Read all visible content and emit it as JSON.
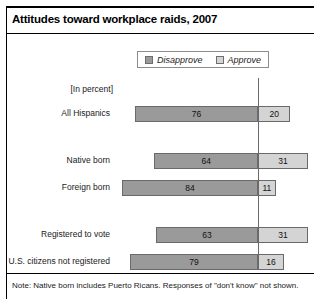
{
  "chart": {
    "title": "Attitudes toward workplace raids, 2007",
    "unit_note": "[In percent]",
    "note": "Note: Native born includes Puerto Ricans. Responses of \"don't know\" not shown."
  },
  "legend": {
    "items": [
      {
        "label": "Disapprove",
        "color": "#9a9a9a"
      },
      {
        "label": "Approve",
        "color": "#d4d4d4"
      }
    ]
  },
  "chart_data": {
    "type": "bar",
    "title": "Attitudes toward workplace raids, 2007",
    "subtitle": "[In percent]",
    "orientation": "horizontal",
    "stacked": true,
    "xlabel": "",
    "ylabel": "",
    "note": "Note: Native born includes Puerto Ricans. Responses of \"don't know\" not shown.",
    "legend_position": "top-center",
    "grid": false,
    "divider_at": "boundary between Disapprove and Approve",
    "categories": [
      "All Hispanics",
      "Native born",
      "Foreign born",
      "Registered to vote",
      "U.S. citizens not registered"
    ],
    "series": [
      {
        "name": "Disapprove",
        "color": "#9a9a9a",
        "values": [
          76,
          64,
          84,
          63,
          79
        ]
      },
      {
        "name": "Approve",
        "color": "#d4d4d4",
        "values": [
          20,
          31,
          11,
          31,
          16
        ]
      }
    ],
    "rows": [
      {
        "label": "All Hispanics",
        "disapprove": 76,
        "approve": 20,
        "group": 1
      },
      {
        "label": "Native born",
        "disapprove": 64,
        "approve": 31,
        "group": 2
      },
      {
        "label": "Foreign born",
        "disapprove": 84,
        "approve": 11,
        "group": 2
      },
      {
        "label": "Registered to vote",
        "disapprove": 63,
        "approve": 31,
        "group": 3
      },
      {
        "label": "U.S. citizens not registered",
        "disapprove": 79,
        "approve": 16,
        "group": 3
      }
    ]
  }
}
